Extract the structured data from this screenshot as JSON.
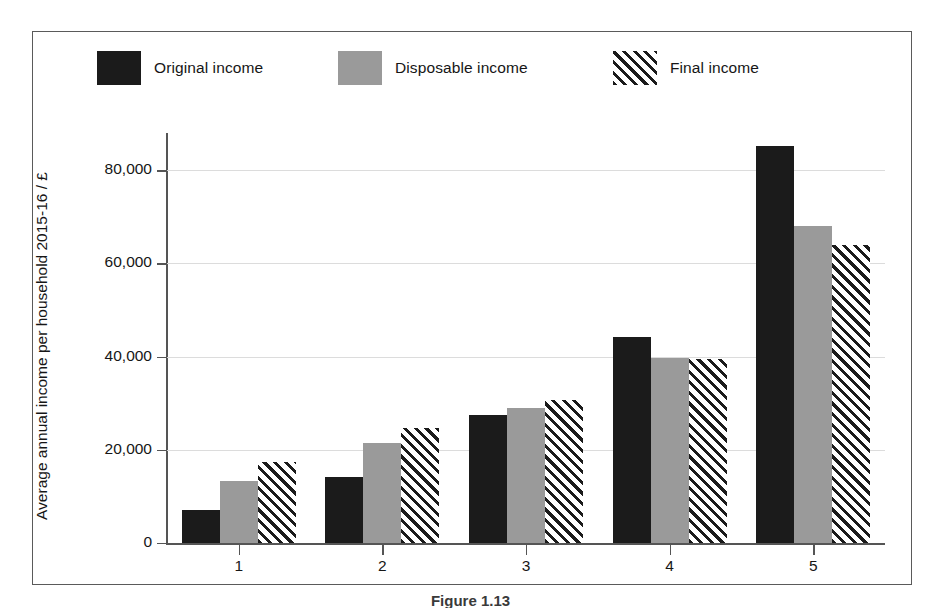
{
  "chart_data": {
    "type": "bar",
    "title": "",
    "xlabel": "",
    "ylabel": "Average annual income per household 2015-16 / £",
    "categories": [
      "1",
      "2",
      "3",
      "4",
      "5"
    ],
    "series": [
      {
        "name": "Original income",
        "style": "solid-black",
        "values": [
          7000,
          14200,
          27500,
          44300,
          85200
        ]
      },
      {
        "name": "Disposable income",
        "style": "solid-gray",
        "values": [
          13300,
          21400,
          29000,
          39800,
          68000
        ]
      },
      {
        "name": "Final income",
        "style": "hatched",
        "values": [
          17400,
          24700,
          30800,
          39500,
          64000
        ]
      }
    ],
    "ylim": [
      0,
      88000
    ],
    "yticks": [
      0,
      20000,
      40000,
      60000,
      80000
    ],
    "ytick_labels": [
      "0",
      "20,000",
      "40,000",
      "60,000",
      "80,000"
    ],
    "grid": true,
    "grid_axis": "y",
    "legend_position": "top"
  },
  "legend": {
    "items": [
      {
        "label": "Original income",
        "swatch": "black-square-swatch",
        "x": 0
      },
      {
        "label": "Disposable income",
        "swatch": "gray-square-swatch",
        "x": 241
      },
      {
        "label": "Final income",
        "swatch": "hatched-square-swatch",
        "x": 516
      }
    ]
  },
  "axes": {
    "y_label": "Average annual income per household 2015-16 / £",
    "y_tick_labels": [
      "80,000",
      "60,000",
      "40,000",
      "20,000",
      "0"
    ],
    "x_tick_labels": [
      "1",
      "2",
      "3",
      "4",
      "5"
    ]
  },
  "caption": {
    "text": "Figure 1.13"
  },
  "colors": {
    "original": "#1b1b1b",
    "disposable": "#9a9a9a",
    "final_hatch": "#1b1b1b",
    "grid": "#dcdcdc",
    "axis": "#555555",
    "frame": "#5a5a5a"
  }
}
